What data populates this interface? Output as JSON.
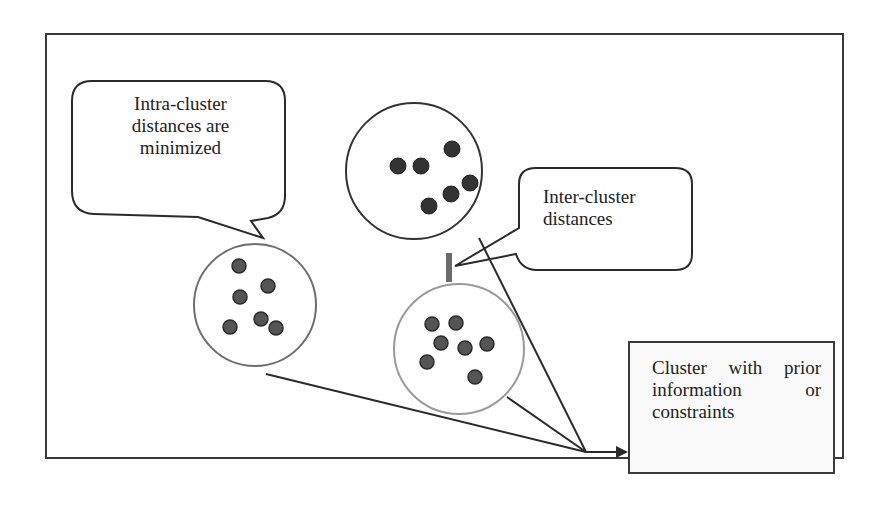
{
  "diagram": {
    "type": "clustering-concept",
    "callouts": {
      "intra": {
        "lines": [
          "Intra-cluster",
          "distances are",
          "minimized"
        ]
      },
      "inter": {
        "lines": [
          "Inter-cluster",
          "distances"
        ]
      }
    },
    "constraint_box": {
      "lines": [
        "Cluster with prior",
        "information or",
        "constraints"
      ]
    },
    "colors": {
      "frame": "#3a3a3a",
      "line": "#2a2a2a",
      "point_fill": "#555555",
      "point_stroke": "#2a2a2a",
      "cluster_outline_dark": "#333333",
      "cluster_outline_light": "#8a8a8a",
      "distance_marker": "#6a6a6a"
    },
    "clusters": [
      {
        "name": "left-cluster",
        "center": [
          255,
          305
        ],
        "radius": 61,
        "outline": "light",
        "points": [
          [
            239,
            266
          ],
          [
            240,
            297
          ],
          [
            268,
            286
          ],
          [
            230,
            327
          ],
          [
            261,
            319
          ],
          [
            276,
            328
          ]
        ]
      },
      {
        "name": "top-cluster",
        "center": [
          414,
          171
        ],
        "radius": 68,
        "outline": "dark",
        "points": [
          [
            398,
            166
          ],
          [
            421,
            166
          ],
          [
            452,
            149
          ],
          [
            470,
            183
          ],
          [
            451,
            194
          ],
          [
            429,
            206
          ]
        ]
      },
      {
        "name": "bottom-cluster",
        "center": [
          459,
          349
        ],
        "radius": 65,
        "outline": "light",
        "points": [
          [
            432,
            324
          ],
          [
            456,
            323
          ],
          [
            441,
            343
          ],
          [
            465,
            348
          ],
          [
            487,
            344
          ],
          [
            427,
            362
          ],
          [
            475,
            377
          ]
        ]
      }
    ]
  }
}
